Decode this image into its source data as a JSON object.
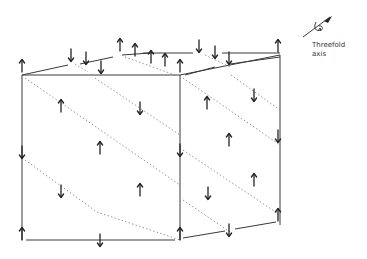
{
  "figure": {
    "type": "spin-structure-diagram",
    "legend": {
      "icon": "threefold-axis-icon",
      "line1": "Threefold",
      "line2": "axis"
    },
    "colors": {
      "line": "#3a3a3a",
      "dotted": "#8a8a8a",
      "arrow": "#222222",
      "background": "#ffffff"
    },
    "edges": [
      [
        22,
        75,
        180,
        75
      ],
      [
        180,
        75,
        280,
        55
      ],
      [
        22,
        75,
        68,
        65
      ],
      [
        80,
        64,
        113,
        57
      ],
      [
        122,
        55,
        150,
        53
      ],
      [
        143,
        53,
        193,
        53
      ],
      [
        222,
        53,
        280,
        53
      ],
      [
        185,
        75,
        215,
        67
      ],
      [
        230,
        64,
        280,
        57
      ],
      [
        22,
        75,
        22,
        240
      ],
      [
        180,
        75,
        180,
        240
      ],
      [
        280,
        55,
        280,
        225
      ],
      [
        26,
        240,
        175,
        240
      ],
      [
        183,
        238,
        225,
        231
      ],
      [
        235,
        229,
        276,
        222
      ]
    ],
    "dotted": [
      [
        25,
        78,
        180,
        185
      ],
      [
        95,
        78,
        180,
        135
      ],
      [
        25,
        160,
        97,
        212
      ],
      [
        97,
        212,
        180,
        240
      ],
      [
        183,
        78,
        280,
        145
      ],
      [
        183,
        150,
        280,
        215
      ],
      [
        183,
        200,
        230,
        232
      ],
      [
        231,
        75,
        280,
        110
      ],
      [
        75,
        64,
        88,
        72
      ],
      [
        125,
        57,
        175,
        75
      ],
      [
        205,
        55,
        230,
        67
      ]
    ],
    "arrows": [
      {
        "x": 22,
        "y": 66,
        "dir": "up"
      },
      {
        "x": 71,
        "y": 55,
        "dir": "down"
      },
      {
        "x": 86,
        "y": 58,
        "dir": "down"
      },
      {
        "x": 101,
        "y": 67,
        "dir": "down"
      },
      {
        "x": 120,
        "y": 45,
        "dir": "up"
      },
      {
        "x": 135,
        "y": 50,
        "dir": "up"
      },
      {
        "x": 151,
        "y": 57,
        "dir": "up"
      },
      {
        "x": 165,
        "y": 60,
        "dir": "up"
      },
      {
        "x": 180,
        "y": 66,
        "dir": "up"
      },
      {
        "x": 199,
        "y": 46,
        "dir": "down"
      },
      {
        "x": 215,
        "y": 52,
        "dir": "down"
      },
      {
        "x": 229,
        "y": 58,
        "dir": "down"
      },
      {
        "x": 278,
        "y": 46,
        "dir": "up"
      },
      {
        "x": 61,
        "y": 106,
        "dir": "up"
      },
      {
        "x": 140,
        "y": 108,
        "dir": "down"
      },
      {
        "x": 22,
        "y": 152,
        "dir": "down"
      },
      {
        "x": 100,
        "y": 148,
        "dir": "up"
      },
      {
        "x": 180,
        "y": 150,
        "dir": "down"
      },
      {
        "x": 61,
        "y": 191,
        "dir": "down"
      },
      {
        "x": 140,
        "y": 190,
        "dir": "up"
      },
      {
        "x": 207,
        "y": 103,
        "dir": "up"
      },
      {
        "x": 254,
        "y": 95,
        "dir": "down"
      },
      {
        "x": 229,
        "y": 140,
        "dir": "up"
      },
      {
        "x": 278,
        "y": 136,
        "dir": "down"
      },
      {
        "x": 208,
        "y": 193,
        "dir": "down"
      },
      {
        "x": 254,
        "y": 180,
        "dir": "up"
      },
      {
        "x": 278,
        "y": 215,
        "dir": "up"
      },
      {
        "x": 22,
        "y": 234,
        "dir": "up"
      },
      {
        "x": 100,
        "y": 240,
        "dir": "down"
      },
      {
        "x": 180,
        "y": 234,
        "dir": "up"
      },
      {
        "x": 229,
        "y": 230,
        "dir": "down"
      }
    ]
  }
}
